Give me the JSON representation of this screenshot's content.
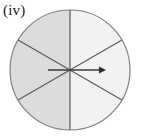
{
  "figure": {
    "label": "(iv)",
    "caption_text": "(iv)",
    "canvas": {
      "width": 141,
      "height": 138
    }
  },
  "diagram": {
    "type": "sector-circle",
    "circle": {
      "center_x": 70,
      "center_y": 70,
      "radius": 60,
      "outline_color": "#808080",
      "outline_width": 1.2
    },
    "sector_count": 6,
    "sector_span_degrees": 60,
    "divider_color": "#5a5a5a",
    "divider_width": 1.2,
    "dividers": [
      {
        "name": "vertical-diameter",
        "angle_degrees": 90
      },
      {
        "name": "diagonal-diameter-up-right",
        "angle_degrees": 30
      },
      {
        "name": "diagonal-diameter-up-left",
        "angle_degrees": 150
      }
    ],
    "sectors": [
      {
        "name": "sector-right-upper",
        "start_degrees": 30,
        "end_degrees": 90,
        "fill": "#f2f2f2"
      },
      {
        "name": "sector-top-left",
        "start_degrees": 90,
        "end_degrees": 150,
        "fill": "#dcdcdc"
      },
      {
        "name": "sector-left-upper",
        "start_degrees": 150,
        "end_degrees": 210,
        "fill": "#dcdcdc"
      },
      {
        "name": "sector-left-lower",
        "start_degrees": 210,
        "end_degrees": 270,
        "fill": "#dcdcdc"
      },
      {
        "name": "sector-bottom-right",
        "start_degrees": 270,
        "end_degrees": 330,
        "fill": "#f2f2f2"
      },
      {
        "name": "sector-right-lower",
        "start_degrees": 330,
        "end_degrees": 390,
        "fill": "#f2f2f2"
      }
    ],
    "shaded_half": "left",
    "shaded_fraction": "3/6",
    "arrow": {
      "name": "radius-arrow",
      "direction": "right",
      "angle_degrees": 0,
      "from_x": 48,
      "from_y": 70,
      "to_x": 104,
      "to_y": 70,
      "color": "#3a3a3a",
      "line_width": 1.6,
      "head_length": 8,
      "head_width": 7
    }
  }
}
